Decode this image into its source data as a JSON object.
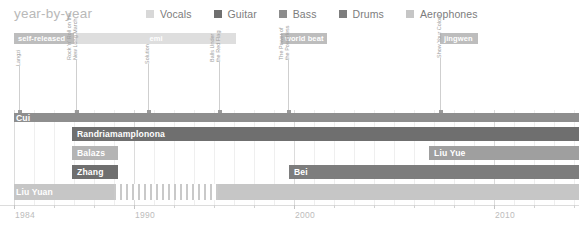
{
  "header": {
    "title": "year-by-year"
  },
  "legend": {
    "items": [
      {
        "label": "Vocals",
        "color": "#d8d8d8",
        "icon": "legend-swatch-icon"
      },
      {
        "label": "Guitar",
        "color": "#6f6f6f",
        "icon": "legend-swatch-icon"
      },
      {
        "label": "Bass",
        "color": "#8c8c8c",
        "icon": "legend-swatch-icon"
      },
      {
        "label": "Drums",
        "color": "#7d7d7d",
        "icon": "legend-swatch-icon"
      },
      {
        "label": "Aerophones",
        "color": "#c6c6c6",
        "icon": "legend-swatch-icon"
      }
    ]
  },
  "record_labels": [
    {
      "name": "self-released",
      "x": 14,
      "w": 60,
      "style": "solid"
    },
    {
      "name": "emi",
      "x": 76,
      "w": 160,
      "style": "light"
    },
    {
      "name": "world beat",
      "x": 281,
      "w": 46,
      "style": "solid"
    },
    {
      "name": "jingwen",
      "x": 440,
      "w": 38,
      "style": "solid"
    }
  ],
  "albums": [
    {
      "name": "Langzi",
      "lines": [
        "Langzi"
      ],
      "x": 19,
      "h": 46
    },
    {
      "name": "Rock 'n' Roll on the New Long March",
      "lines": [
        "Rock 'n' Roll on the",
        "New Long March"
      ],
      "x": 76,
      "h": 52
    },
    {
      "name": "Solution",
      "lines": [
        "Solution"
      ],
      "x": 148,
      "h": 48
    },
    {
      "name": "Balls Under the Red Flag",
      "lines": [
        "Balls Under",
        "the Red Flag"
      ],
      "x": 219,
      "h": 50
    },
    {
      "name": "The Power of the Powerless",
      "lines": [
        "The Power of",
        "the Powerless"
      ],
      "x": 288,
      "h": 52
    },
    {
      "name": "Show You Colour",
      "lines": [
        "Show Your Colour"
      ],
      "x": 440,
      "h": 54
    }
  ],
  "tracks": [
    {
      "name": "Cui",
      "role": "Vocals",
      "label_x": 16,
      "y": 3,
      "height": 9,
      "segments": [
        {
          "x": 14,
          "w": 565,
          "color": "#8e8e8e"
        }
      ]
    },
    {
      "name": "Randriamamplonona",
      "role": "Guitar",
      "label_x": 77,
      "y": 17,
      "height": 14,
      "segments": [
        {
          "x": 72,
          "w": 507,
          "color": "#6f6f6f"
        }
      ]
    },
    {
      "name": "Balazs",
      "role": "Bass",
      "label_x": 77,
      "y": 36,
      "height": 14,
      "segments": [
        {
          "x": 72,
          "w": 46,
          "color": "#b4b4b4"
        }
      ]
    },
    {
      "name": "Liu Yue",
      "role": "Bass",
      "label_x": 434,
      "y": 36,
      "height": 14,
      "segments": [
        {
          "x": 429,
          "w": 150,
          "color": "#9f9f9f"
        }
      ]
    },
    {
      "name": "Zhang",
      "role": "Drums",
      "label_x": 77,
      "y": 55,
      "height": 14,
      "segments": [
        {
          "x": 72,
          "w": 46,
          "color": "#6f6f6f"
        }
      ]
    },
    {
      "name": "Bei",
      "role": "Drums",
      "label_x": 294,
      "y": 55,
      "height": 14,
      "segments": [
        {
          "x": 289,
          "w": 290,
          "color": "#7d7d7d"
        }
      ]
    },
    {
      "name": "Liu Yuan",
      "role": "Aerophones",
      "label_x": 16,
      "y": 74,
      "height": 16,
      "segments": [
        {
          "x": 14,
          "w": 100,
          "color": "#c6c6c6"
        },
        {
          "x": 114,
          "w": 104,
          "color": "striped"
        },
        {
          "x": 218,
          "w": 361,
          "color": "#c6c6c6"
        }
      ]
    }
  ],
  "axis": {
    "ticks": [
      {
        "year": "1984",
        "x": 14,
        "major": true
      },
      {
        "year": "",
        "x": 54,
        "major": false
      },
      {
        "year": "",
        "x": 94,
        "major": false
      },
      {
        "year": "1990",
        "x": 134,
        "major": true
      },
      {
        "year": "",
        "x": 174,
        "major": false
      },
      {
        "year": "",
        "x": 214,
        "major": false
      },
      {
        "year": "",
        "x": 254,
        "major": false
      },
      {
        "year": "2000",
        "x": 294,
        "major": true
      },
      {
        "year": "",
        "x": 334,
        "major": false
      },
      {
        "year": "",
        "x": 374,
        "major": false
      },
      {
        "year": "",
        "x": 414,
        "major": false
      },
      {
        "year": "",
        "x": 454,
        "major": false
      },
      {
        "year": "2010",
        "x": 494,
        "major": true
      },
      {
        "year": "",
        "x": 534,
        "major": false
      },
      {
        "year": "",
        "x": 574,
        "major": false
      }
    ],
    "gridlines": [
      {
        "x": 14,
        "major": true
      },
      {
        "x": 34,
        "major": false
      },
      {
        "x": 54,
        "major": false
      },
      {
        "x": 74,
        "major": false
      },
      {
        "x": 94,
        "major": false
      },
      {
        "x": 114,
        "major": false
      },
      {
        "x": 134,
        "major": true
      },
      {
        "x": 154,
        "major": false
      },
      {
        "x": 174,
        "major": false
      },
      {
        "x": 194,
        "major": false
      },
      {
        "x": 214,
        "major": false
      },
      {
        "x": 234,
        "major": false
      },
      {
        "x": 254,
        "major": false
      },
      {
        "x": 274,
        "major": false
      },
      {
        "x": 294,
        "major": true
      },
      {
        "x": 314,
        "major": false
      },
      {
        "x": 334,
        "major": false
      },
      {
        "x": 354,
        "major": false
      },
      {
        "x": 374,
        "major": false
      },
      {
        "x": 394,
        "major": false
      },
      {
        "x": 414,
        "major": false
      },
      {
        "x": 434,
        "major": false
      },
      {
        "x": 454,
        "major": false
      },
      {
        "x": 474,
        "major": false
      },
      {
        "x": 494,
        "major": true
      },
      {
        "x": 514,
        "major": false
      },
      {
        "x": 534,
        "major": false
      },
      {
        "x": 554,
        "major": false
      },
      {
        "x": 574,
        "major": false
      }
    ]
  },
  "chart_data": {
    "type": "bar",
    "title": "year-by-year",
    "xlabel": "",
    "ylabel": "",
    "xlim": [
      1984,
      2013
    ],
    "grid": true,
    "legend_position": "top-right",
    "categories": [
      "Cui",
      "Randriamamplonona",
      "Balazs",
      "Liu Yue",
      "Zhang",
      "Bei",
      "Liu Yuan"
    ],
    "series": [
      {
        "name": "Vocals",
        "members": [
          "Cui"
        ],
        "start": [
          1984
        ],
        "end": [
          2013
        ]
      },
      {
        "name": "Guitar",
        "members": [
          "Randriamamplonona"
        ],
        "start": [
          1987
        ],
        "end": [
          2013
        ]
      },
      {
        "name": "Bass",
        "members": [
          "Balazs",
          "Liu Yue"
        ],
        "start": [
          1987,
          2005
        ],
        "end": [
          1989,
          2013
        ]
      },
      {
        "name": "Drums",
        "members": [
          "Zhang",
          "Bei"
        ],
        "start": [
          1987,
          1998
        ],
        "end": [
          1989,
          2013
        ]
      },
      {
        "name": "Aerophones",
        "members": [
          "Liu Yuan"
        ],
        "start": [
          1984
        ],
        "end": [
          2013
        ]
      }
    ],
    "record_labels": [
      {
        "name": "self-released",
        "start": 1984,
        "end": 1987
      },
      {
        "name": "emi",
        "start": 1987,
        "end": 1995
      },
      {
        "name": "world beat",
        "start": 1998,
        "end": 2000
      },
      {
        "name": "jingwen",
        "start": 2005,
        "end": 2007
      }
    ],
    "albums": [
      {
        "name": "Langzi",
        "year": 1984
      },
      {
        "name": "Rock 'n' Roll on the New Long March",
        "year": 1987
      },
      {
        "name": "Solution",
        "year": 1991
      },
      {
        "name": "Balls Under the Red Flag",
        "year": 1994
      },
      {
        "name": "The Power of the Powerless",
        "year": 1998
      },
      {
        "name": "Show Your Colour",
        "year": 2005
      }
    ],
    "xticks": [
      1984,
      1990,
      2000,
      2010
    ]
  }
}
